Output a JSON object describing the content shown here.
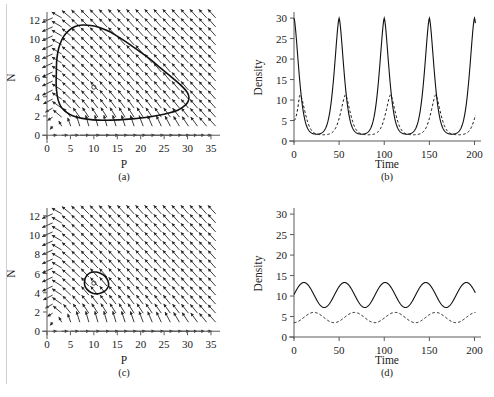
{
  "figure": {
    "background": "#ffffff",
    "ink_color": "#111111",
    "panels": [
      {
        "id": "a",
        "caption": "(a)",
        "type": "phase-portrait",
        "xlabel": "P",
        "ylabel": "N",
        "xlim": [
          0,
          36.5
        ],
        "ylim": [
          -0.6,
          12.6
        ],
        "xticks": [
          0,
          5,
          10,
          15,
          20,
          25,
          30,
          35
        ],
        "yticks": [
          0,
          2,
          4,
          6,
          8,
          10,
          12
        ],
        "equilibrium": [
          10.0,
          5.0
        ],
        "orbit_label": "limit cycle",
        "orbit": [
          [
            2.0,
            6.5
          ],
          [
            2.05,
            7.6
          ],
          [
            2.3,
            8.6
          ],
          [
            2.8,
            9.5
          ],
          [
            3.6,
            10.3
          ],
          [
            4.7,
            10.9
          ],
          [
            6.0,
            11.3
          ],
          [
            7.6,
            11.45
          ],
          [
            9.3,
            11.4
          ],
          [
            11.2,
            11.2
          ],
          [
            13.2,
            10.8
          ],
          [
            15.3,
            10.2
          ],
          [
            17.5,
            9.5
          ],
          [
            19.8,
            8.7
          ],
          [
            22.0,
            7.9
          ],
          [
            24.2,
            7.0
          ],
          [
            26.2,
            6.2
          ],
          [
            27.9,
            5.5
          ],
          [
            29.2,
            4.9
          ],
          [
            30.0,
            4.4
          ],
          [
            30.3,
            3.9
          ],
          [
            30.0,
            3.4
          ],
          [
            29.2,
            3.0
          ],
          [
            27.9,
            2.6
          ],
          [
            26.0,
            2.3
          ],
          [
            23.6,
            2.05
          ],
          [
            21.0,
            1.85
          ],
          [
            18.2,
            1.7
          ],
          [
            15.3,
            1.6
          ],
          [
            12.4,
            1.56
          ],
          [
            9.8,
            1.6
          ],
          [
            7.5,
            1.75
          ],
          [
            5.6,
            2.0
          ],
          [
            4.1,
            2.4
          ],
          [
            3.0,
            2.95
          ],
          [
            2.35,
            3.7
          ],
          [
            2.05,
            4.6
          ],
          [
            1.95,
            5.5
          ],
          [
            2.0,
            6.5
          ]
        ]
      },
      {
        "id": "b",
        "caption": "(b)",
        "type": "time-series",
        "xlabel": "Time",
        "ylabel": "Density",
        "xlim": [
          0,
          205
        ],
        "ylim": [
          0,
          31
        ],
        "xticks": [
          0,
          50,
          100,
          150,
          200
        ],
        "yticks": [
          0,
          5,
          10,
          15,
          20,
          25,
          30
        ],
        "period": 50,
        "series": [
          {
            "name": "prey",
            "style": "solid",
            "peak": 30,
            "trough": 1.6,
            "peak_times": [
              0,
              50,
              100,
              150,
              200
            ]
          },
          {
            "name": "predator",
            "style": "dashed",
            "peak": 11.3,
            "trough": 1.5,
            "peak_times": [
              7,
              57,
              107,
              157
            ],
            "start_value": 5
          }
        ]
      },
      {
        "id": "c",
        "caption": "(c)",
        "type": "phase-portrait",
        "xlabel": "P",
        "ylabel": "N",
        "xlim": [
          0,
          36.5
        ],
        "ylim": [
          -0.6,
          12.6
        ],
        "xticks": [
          0,
          5,
          10,
          15,
          20,
          25,
          30,
          35
        ],
        "yticks": [
          0,
          2,
          4,
          6,
          8,
          10,
          12
        ],
        "equilibrium": [
          10.0,
          5.0
        ],
        "orbit_label": "small limit cycle",
        "orbit": [
          [
            8.0,
            5.0
          ],
          [
            8.15,
            5.5
          ],
          [
            8.7,
            5.9
          ],
          [
            9.5,
            6.12
          ],
          [
            10.5,
            6.15
          ],
          [
            11.5,
            6.0
          ],
          [
            12.4,
            5.7
          ],
          [
            13.0,
            5.25
          ],
          [
            13.15,
            4.8
          ],
          [
            12.8,
            4.4
          ],
          [
            12.1,
            4.1
          ],
          [
            11.2,
            3.92
          ],
          [
            10.2,
            3.9
          ],
          [
            9.3,
            4.05
          ],
          [
            8.55,
            4.35
          ],
          [
            8.1,
            4.7
          ],
          [
            8.0,
            5.0
          ]
        ]
      },
      {
        "id": "d",
        "caption": "(d)",
        "type": "time-series",
        "xlabel": "Time",
        "ylabel": "Density",
        "xlim": [
          0,
          205
        ],
        "ylim": [
          0,
          31
        ],
        "xticks": [
          0,
          50,
          100,
          150,
          200
        ],
        "yticks": [
          0,
          5,
          10,
          15,
          20,
          25,
          30
        ],
        "period": 45,
        "series": [
          {
            "name": "prey",
            "style": "solid",
            "peak": 13.3,
            "trough": 7.2,
            "mean": 10.25,
            "amplitude": 3.05,
            "phase_peak_time": 11,
            "start_value": 10.2
          },
          {
            "name": "predator",
            "style": "dashed",
            "peak": 6.0,
            "trough": 3.5,
            "mean": 4.75,
            "amplitude": 1.25,
            "phase_peak_time": 22,
            "start_value": 3.9
          }
        ]
      }
    ]
  }
}
